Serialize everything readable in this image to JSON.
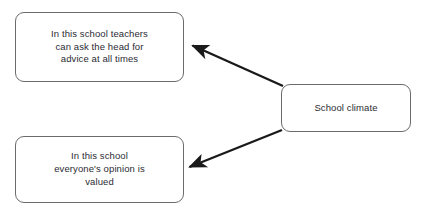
{
  "diagram": {
    "background_color": "#ffffff",
    "node_border_color": "#6b6b6b",
    "node_fill_color": "#ffffff",
    "text_color": "#2b2b33",
    "edge_color": "#1a1a1a",
    "nodes": [
      {
        "id": "teachers",
        "label": "In this school teachers\ncan ask the head for\nadvice at all times"
      },
      {
        "id": "opinion",
        "label": "In this school\neveryone's opinion is\nvalued"
      },
      {
        "id": "climate",
        "label": "School climate"
      }
    ],
    "edges": [
      {
        "id": "climate-to-teachers",
        "from": "climate",
        "to": "teachers",
        "arrowhead": "filled-triangle",
        "label": ""
      },
      {
        "id": "climate-to-opinion",
        "from": "climate",
        "to": "opinion",
        "arrowhead": "filled-triangle",
        "label": ""
      }
    ]
  }
}
